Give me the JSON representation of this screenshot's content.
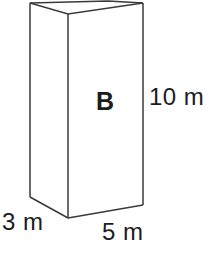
{
  "figure": {
    "type": "rectangular-prism-diagram",
    "solid_label": "B",
    "stroke_color": "#3a3a3a",
    "fill_color": "#ffffff",
    "background_color": "#ffffff",
    "labels": {
      "height": "10 m",
      "depth": "3 m",
      "width": "5 m"
    },
    "dimensions": {
      "height_value": 10,
      "width_value": 5,
      "depth_value": 3,
      "unit": "m"
    },
    "geometry": {
      "front_face": "68,14 143,3 143,205 68,218",
      "left_face": "30,3 68,14 68,218 30,197",
      "top_face": "30,3 108,1 143,3 68,14",
      "front_left_vertical": "68,14 68,218",
      "back_left_vertical": "30,3 30,197",
      "right_vertical": "143,3 143,205",
      "top_left_edge": "30,3 108,1",
      "top_right_edge": "108,1 143,3",
      "top_front_left_edge": "30,3 68,14",
      "top_front_right_edge": "68,14 143,3",
      "bottom_left_edge": "30,197 68,218",
      "bottom_front_edge": "68,218 143,205"
    }
  }
}
